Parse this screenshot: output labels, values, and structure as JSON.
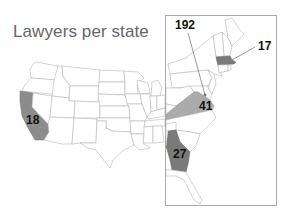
{
  "title": "Lawyers per state",
  "colors": {
    "background": "#ffffff",
    "state_fill": "#ffffff",
    "state_border": "#b5b5b5",
    "highlight_dark": "#7a7a7a",
    "highlight_mid": "#8c8c8c",
    "highlight_light": "#ababab",
    "inset_border": "#aaaaaa"
  },
  "map": {
    "region": "Contiguous United States",
    "inset": "East Coast (enlarged)",
    "highlighted_states": [
      {
        "state": "California",
        "value": "18",
        "fill": "#8c8c8c"
      },
      {
        "state": "District of Columbia",
        "value": "192",
        "fill": "#7a7a7a"
      },
      {
        "state": "Massachusetts",
        "value": "17",
        "fill": "#7a7a7a"
      },
      {
        "state": "Virginia",
        "value": "41",
        "fill": "#ababab"
      },
      {
        "state": "Georgia",
        "value": "27",
        "fill": "#7a7a7a"
      }
    ]
  },
  "labels": {
    "ca": "18",
    "dc": "192",
    "ma": "17",
    "va": "41",
    "ga": "27"
  }
}
